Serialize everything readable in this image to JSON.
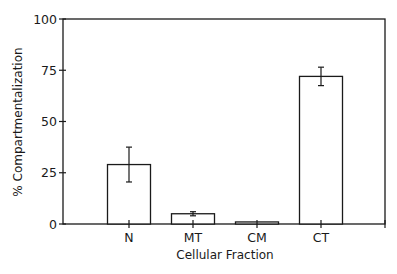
{
  "chart_data": {
    "type": "bar",
    "title": "",
    "xlabel": "Cellular Fraction",
    "ylabel": "% Compartmentalization",
    "categories": [
      "N",
      "MT",
      "CM",
      "CT"
    ],
    "values": [
      29,
      5,
      1,
      72
    ],
    "error": [
      8.5,
      1,
      0.3,
      4.5
    ],
    "ylim": [
      0,
      100
    ],
    "yticks": [
      0,
      25,
      50,
      75,
      100
    ],
    "grid": false,
    "legend": null,
    "colors": {
      "bar_fill": "#ffffff",
      "stroke": "#1a1a1a"
    }
  },
  "axes": {
    "y_tick_labels": [
      "0",
      "25",
      "50",
      "75",
      "100"
    ],
    "x_tick_labels": [
      "N",
      "MT",
      "CM",
      "CT"
    ]
  }
}
